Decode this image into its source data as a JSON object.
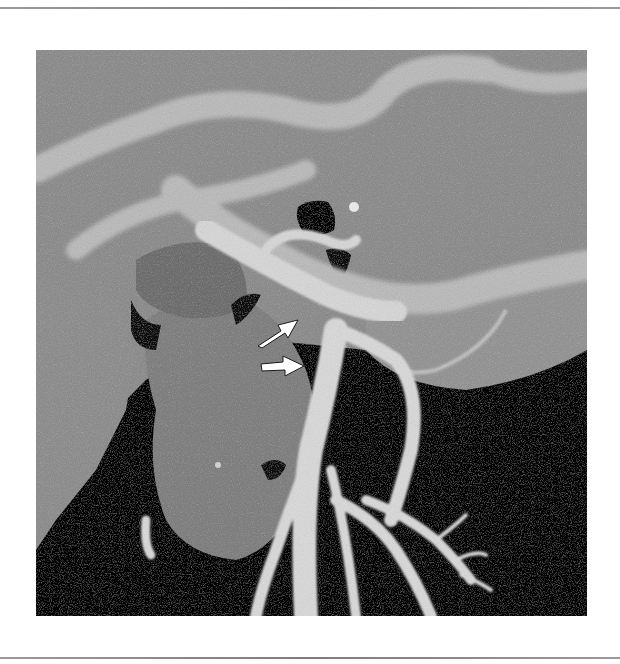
{
  "figure": {
    "type": "grayscale-3d-vascular-render",
    "annotations": [
      {
        "name": "arrow-upper",
        "direction": "up-right",
        "color": "#ffffff"
      },
      {
        "name": "arrow-lower",
        "direction": "right",
        "color": "#ffffff"
      }
    ],
    "colors": {
      "background": "#ffffff",
      "rule": "#8a8a8a",
      "tissue": "#8e8e8e",
      "vessel": "#d8d8d8",
      "void": "#050505",
      "arrow": "#ffffff"
    }
  }
}
